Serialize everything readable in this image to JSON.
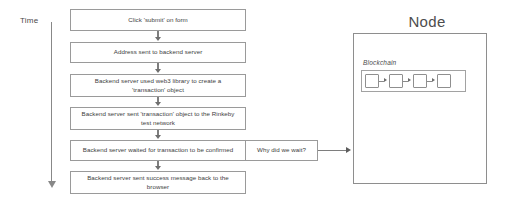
{
  "diagram": {
    "time_axis": {
      "label": "Time",
      "arrow_direction": "down"
    },
    "flow_steps": [
      {
        "id": "step-1",
        "line1": "Click 'submit' on form",
        "line2": ""
      },
      {
        "id": "step-2",
        "line1": "Address sent to backend server",
        "line2": ""
      },
      {
        "id": "step-3",
        "line1": "Backend server used web3 library to create a",
        "line2": "'transaction' object"
      },
      {
        "id": "step-4",
        "line1": "Backend server sent 'transaction' object to the Rinkeby",
        "line2": "test network"
      },
      {
        "id": "step-5",
        "line1": "Backend server waited for transaction to be confirmed",
        "line2": ""
      },
      {
        "id": "step-6",
        "line1": "Backend server sent success message back to the",
        "line2": "browser"
      }
    ],
    "annotation": {
      "label": "Why did we wait?"
    },
    "node_panel": {
      "title": "Node",
      "blockchain_label": "Blockchain",
      "block_count": 4,
      "arrow_count": 3
    },
    "colors": {
      "box_border": "#9a9a9a",
      "node_border": "#8e8e8e",
      "connector": "#7e7e7e",
      "text": "#3d3d3d",
      "background": "#ffffff"
    }
  }
}
